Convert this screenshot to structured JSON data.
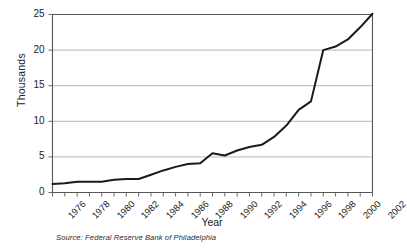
{
  "chart_data": {
    "type": "line",
    "title": "",
    "xlabel": "Year",
    "ylabel": "Thousands",
    "xlim": [
      1976,
      2002
    ],
    "ylim": [
      0,
      25
    ],
    "grid": true,
    "legend": false,
    "source_note": "Source: Federal Reserve Bank of Philadelphia",
    "y_ticks": [
      0,
      5,
      10,
      15,
      20,
      25
    ],
    "y_tick_labels": [
      "0",
      "5",
      "10",
      "15",
      "20",
      "25"
    ],
    "x_tick_labels": [
      "1976",
      "1978",
      "1980",
      "1982",
      "1984",
      "1986",
      "1988",
      "1990",
      "1992",
      "1994",
      "1996",
      "1998",
      "2000",
      "2002"
    ],
    "x_minor_ticks_every_year": true,
    "series": [
      {
        "name": "Value",
        "color": "#1a1a1a",
        "x": [
          1976,
          1977,
          1978,
          1979,
          1980,
          1981,
          1982,
          1983,
          1984,
          1985,
          1986,
          1987,
          1988,
          1989,
          1990,
          1991,
          1992,
          1993,
          1994,
          1995,
          1996,
          1997,
          1998,
          1999,
          2000,
          2001,
          2002
        ],
        "values": [
          1.2,
          1.3,
          1.5,
          1.5,
          1.5,
          1.8,
          1.9,
          1.9,
          2.5,
          3.1,
          3.6,
          4.0,
          4.1,
          5.5,
          5.2,
          5.9,
          6.4,
          6.7,
          7.8,
          9.4,
          11.6,
          12.8,
          20.0,
          20.5,
          21.5,
          23.2,
          25.1
        ]
      }
    ]
  },
  "labels": {
    "y_axis_title": "Thousands",
    "x_axis_title": "Year",
    "source": "Source: Federal Reserve Bank of Philadelphia"
  },
  "colors": {
    "line": "#1a1a1a",
    "grid": "#aeaeae",
    "frame": "#555555",
    "background": "#ffffff",
    "text": "#242424"
  }
}
